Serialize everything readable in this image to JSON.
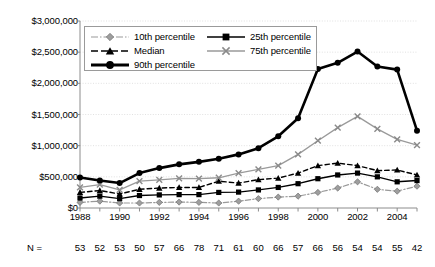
{
  "chart_data": {
    "type": "line",
    "title": "",
    "xlabel": "",
    "ylabel": "",
    "x": [
      1988,
      1989,
      1990,
      1991,
      1992,
      1993,
      1994,
      1995,
      1996,
      1997,
      1998,
      1999,
      2000,
      2001,
      2002,
      2003,
      2004,
      2005
    ],
    "xtick_labels": [
      "1988",
      "1990",
      "1992",
      "1994",
      "1996",
      "1998",
      "2000",
      "2002",
      "2004"
    ],
    "xtick_values": [
      1988,
      1990,
      1992,
      1994,
      1996,
      1998,
      2000,
      2002,
      2004
    ],
    "ytick_labels": [
      "$0",
      "$500,000",
      "$1,000,000",
      "$1,500,000",
      "$2,000,000",
      "$2,500,000",
      "$3,000,000"
    ],
    "ytick_values": [
      0,
      500000,
      1000000,
      1500000,
      2000000,
      2500000,
      3000000
    ],
    "ylim": [
      0,
      3000000
    ],
    "xlim": [
      1988,
      2005
    ],
    "grid": "horizontal",
    "legend_position": "upper-left-inside",
    "series": [
      {
        "name": "10th percentile",
        "color": "#999999",
        "marker": "diamond",
        "dash": "dashdot",
        "width": 1.2,
        "values": [
          90000,
          110000,
          80000,
          80000,
          90000,
          95000,
          90000,
          80000,
          110000,
          150000,
          175000,
          190000,
          250000,
          320000,
          420000,
          300000,
          270000,
          350000
        ]
      },
      {
        "name": "25th percentile",
        "color": "#000000",
        "marker": "square",
        "dash": "solid",
        "width": 1.4,
        "values": [
          160000,
          190000,
          150000,
          200000,
          210000,
          215000,
          215000,
          250000,
          255000,
          290000,
          330000,
          390000,
          470000,
          530000,
          560000,
          500000,
          420000,
          440000
        ]
      },
      {
        "name": "Median",
        "color": "#000000",
        "marker": "triangle",
        "dash": "dashed",
        "width": 1.4,
        "values": [
          250000,
          280000,
          225000,
          300000,
          320000,
          330000,
          330000,
          430000,
          400000,
          455000,
          480000,
          560000,
          680000,
          720000,
          680000,
          600000,
          610000,
          530000
        ]
      },
      {
        "name": "75th percentile",
        "color": "#9a9a9a",
        "marker": "x",
        "dash": "solid",
        "width": 1.3,
        "values": [
          330000,
          375000,
          290000,
          430000,
          450000,
          475000,
          470000,
          485000,
          560000,
          620000,
          680000,
          860000,
          1080000,
          1290000,
          1470000,
          1270000,
          1100000,
          1010000
        ]
      },
      {
        "name": "90th percentile",
        "color": "#000000",
        "marker": "circle",
        "dash": "solid",
        "width": 2.6,
        "values": [
          490000,
          440000,
          400000,
          560000,
          640000,
          700000,
          740000,
          790000,
          860000,
          960000,
          1150000,
          1440000,
          2230000,
          2330000,
          2510000,
          2270000,
          2220000,
          1240000
        ]
      }
    ],
    "n_row": {
      "label": "N =",
      "values": [
        "53",
        "52",
        "53",
        "50",
        "57",
        "66",
        "78",
        "71",
        "61",
        "60",
        "66",
        "57",
        "66",
        "56",
        "54",
        "54",
        "55",
        "42"
      ]
    }
  },
  "legend": {
    "items": [
      {
        "label": "10th percentile"
      },
      {
        "label": "25th percentile"
      },
      {
        "label": "Median"
      },
      {
        "label": "75th percentile"
      },
      {
        "label": "90th percentile"
      }
    ]
  }
}
